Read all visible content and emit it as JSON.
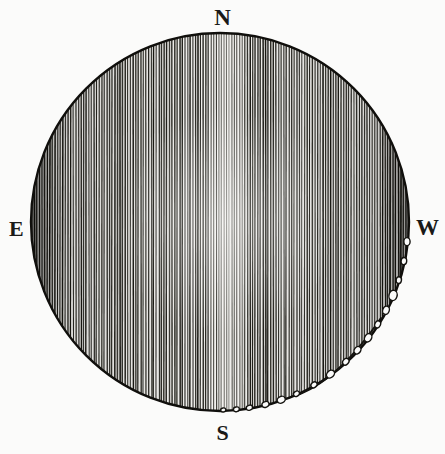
{
  "figure": {
    "kind": "engraving-disc-diagram",
    "background_color": "#fbfbfa",
    "ink_color": "#14130f",
    "caption": "",
    "disc": {
      "center_x": 220,
      "center_y": 222,
      "radius": 189,
      "outline_color": "#100f0c",
      "outline_width": 2.4,
      "fill_color": "#f2f1ee",
      "hatching": {
        "orientation": "vertical",
        "line_spacing_px": 2.6,
        "line_width_px": 1.25,
        "line_color": "#16150f",
        "description": "dense vertical engraved hatch lines filling the disc"
      },
      "center_band": {
        "present": true,
        "x_center": 228,
        "width": 22,
        "description": "faint lighter vertical band through the disc centre"
      }
    },
    "inner_arc": {
      "description": "fine curved line inside the lower-right limb",
      "stroke_color": "#14130f",
      "stroke_width": 2.0,
      "start_x": 300,
      "start_y": 394,
      "control_x": 340,
      "control_y": 378,
      "end_x": 381,
      "end_y": 318
    },
    "limb_chain": {
      "description": "chain of small open ellipses following the lower-right limb of the disc",
      "stroke_color": "#14130f",
      "stroke_width": 1.4,
      "fill_color": "#fbfbfa",
      "count": 17,
      "angles_deg": [
        6,
        12,
        18,
        23,
        28,
        33,
        38,
        43,
        48,
        54,
        60,
        66,
        71,
        76,
        81,
        85,
        89
      ],
      "radii_px": [
        4.0,
        3.6,
        3.4,
        5.2,
        4.2,
        3.6,
        4.4,
        4.0,
        3.6,
        4.4,
        3.4,
        3.2,
        4.2,
        3.6,
        3.2,
        3.0,
        2.6
      ]
    }
  },
  "labels": {
    "north": "N",
    "east": "E",
    "west": "W",
    "south": "S"
  },
  "chart_data": {
    "type": "scatter",
    "title": "",
    "subtitle": "",
    "xlabel": "",
    "ylabel": "",
    "orientation_labels": [
      "N",
      "E",
      "W",
      "S"
    ],
    "series": [
      {
        "name": "limb-chain-circles",
        "marker": "open-circle",
        "angles_deg": [
          6,
          12,
          18,
          23,
          28,
          33,
          38,
          43,
          48,
          54,
          60,
          66,
          71,
          76,
          81,
          85,
          89
        ],
        "radii_px": [
          4.0,
          3.6,
          3.4,
          5.2,
          4.2,
          3.6,
          4.4,
          4.0,
          3.6,
          4.4,
          3.4,
          3.2,
          4.2,
          3.6,
          3.2,
          3.0,
          2.6
        ],
        "count": 17
      }
    ],
    "disc_center": [
      220,
      222
    ],
    "disc_radius": 189,
    "grid": false,
    "legend": "none"
  }
}
